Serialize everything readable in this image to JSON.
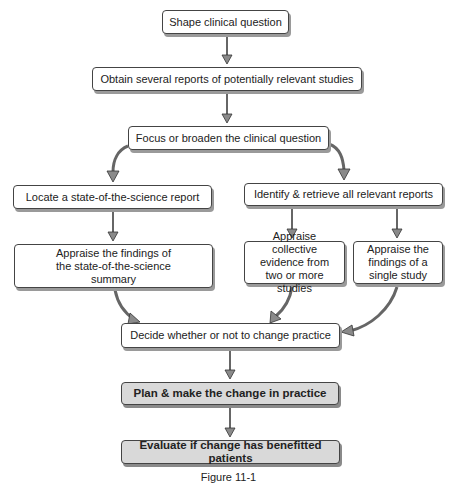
{
  "diagram": {
    "type": "flowchart",
    "nodes": {
      "shape_question": "Shape clinical question",
      "obtain_reports": "Obtain several reports of potentially relevant studies",
      "focus_broaden": "Focus or broaden the clinical question",
      "locate_report": "Locate a state-of-the-science report",
      "identify_retrieve": "Identify & retrieve all relevant reports",
      "appraise_summary": "Appraise the findings of the state-of-the-science summary",
      "appraise_collective": "Appraise collective evidence from two or more studies",
      "appraise_single": "Appraise the findings of a single study",
      "decide_change": "Decide whether or not to change practice",
      "plan_change": "Plan & make the change in practice",
      "evaluate_change": "Evaluate if change has benefitted patients"
    },
    "edges": [
      [
        "shape_question",
        "obtain_reports"
      ],
      [
        "obtain_reports",
        "focus_broaden"
      ],
      [
        "focus_broaden",
        "locate_report"
      ],
      [
        "focus_broaden",
        "identify_retrieve"
      ],
      [
        "locate_report",
        "appraise_summary"
      ],
      [
        "identify_retrieve",
        "appraise_collective"
      ],
      [
        "identify_retrieve",
        "appraise_single"
      ],
      [
        "appraise_summary",
        "decide_change"
      ],
      [
        "appraise_collective",
        "decide_change"
      ],
      [
        "appraise_single",
        "decide_change"
      ],
      [
        "decide_change",
        "plan_change"
      ],
      [
        "plan_change",
        "evaluate_change"
      ]
    ],
    "colors": {
      "box_fill": "#ffffff",
      "shaded_fill": "#d9d9d9",
      "border": "#444444",
      "arrow": "#777777"
    },
    "caption": "Figure 11-1"
  }
}
